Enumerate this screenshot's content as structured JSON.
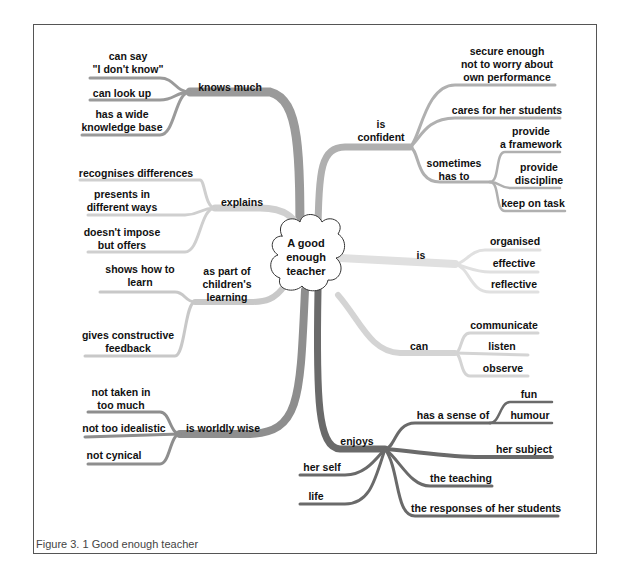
{
  "center": {
    "line1": "A good",
    "line2": "enough",
    "line3": "teacher"
  },
  "caption": "Figure 3. 1  Good enough teacher",
  "colors": {
    "knows": "#9a9a9a",
    "explains": "#cfcfcf",
    "children": "#c8c8c8",
    "worldly": "#8e8e8e",
    "enjoys": "#6a6a6a",
    "confident": "#b0b0b0",
    "is": "#e0e0e0",
    "can": "#d4d4d4"
  },
  "branches": {
    "knows_much": {
      "label": "knows much",
      "children": [
        {
          "l1": "can say",
          "l2": "\"I don't know\""
        },
        {
          "l1": "can look up"
        },
        {
          "l1": "has a wide",
          "l2": "knowledge base"
        }
      ]
    },
    "explains": {
      "label": "explains",
      "children": [
        {
          "l1": "recognises differences"
        },
        {
          "l1": "presents in",
          "l2": "different ways"
        },
        {
          "l1": "doesn't impose",
          "l2": "but offers"
        }
      ]
    },
    "children_learning": {
      "l1": "as part of",
      "l2": "children's",
      "l3": "learning",
      "children": [
        {
          "l1": "shows how to",
          "l2": "learn"
        },
        {
          "l1": "gives constructive",
          "l2": "feedback"
        }
      ]
    },
    "worldly_wise": {
      "label": "is worldly wise",
      "children": [
        {
          "l1": "not taken in",
          "l2": "too much"
        },
        {
          "l1": "not too idealistic"
        },
        {
          "l1": "not cynical"
        }
      ]
    },
    "is_confident": {
      "l1": "is",
      "l2": "confident",
      "children": [
        {
          "l1": "secure enough",
          "l2": "not to worry about",
          "l3": "own performance"
        },
        {
          "l1": "cares for her students"
        }
      ],
      "sometimes": {
        "l1": "sometimes",
        "l2": "has to",
        "children": [
          {
            "l1": "provide",
            "l2": "a framework"
          },
          {
            "l1": "provide",
            "l2": "discipline"
          },
          {
            "l1": "keep on task"
          }
        ]
      }
    },
    "is": {
      "label": "is",
      "children": [
        "organised",
        "effective",
        "reflective"
      ]
    },
    "can": {
      "label": "can",
      "children": [
        "communicate",
        "listen",
        "observe"
      ]
    },
    "enjoys": {
      "label": "enjoys",
      "sense": {
        "label": "has a sense of",
        "children": [
          "fun",
          "humour"
        ]
      },
      "children": [
        "her subject",
        "the teaching",
        "the responses of her students",
        "her self",
        "life"
      ]
    }
  }
}
